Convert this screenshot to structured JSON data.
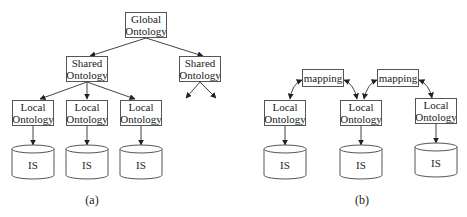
{
  "diagram_a": {
    "global": {
      "line1": "Global",
      "line2": "Ontology"
    },
    "shared_left": {
      "line1": "Shared",
      "line2": "Ontology"
    },
    "shared_right": {
      "line1": "Shared",
      "line2": "Ontology"
    },
    "locals": [
      {
        "line1": "Local",
        "line2": "Ontology"
      },
      {
        "line1": "Local",
        "line2": "Ontology"
      },
      {
        "line1": "Local",
        "line2": "Ontology"
      }
    ],
    "sources": [
      "IS",
      "IS",
      "IS"
    ],
    "caption": "(a)"
  },
  "diagram_b": {
    "mappings": [
      "mapping",
      "mapping"
    ],
    "locals": [
      {
        "line1": "Local",
        "line2": "Ontology"
      },
      {
        "line1": "Local",
        "line2": "Ontology"
      },
      {
        "line1": "Local",
        "line2": "Ontology"
      }
    ],
    "sources": [
      "IS",
      "IS",
      "IS"
    ],
    "caption": "(b)"
  },
  "colors": {
    "stroke": "#555555",
    "text": "#222222",
    "background": "#ffffff"
  }
}
